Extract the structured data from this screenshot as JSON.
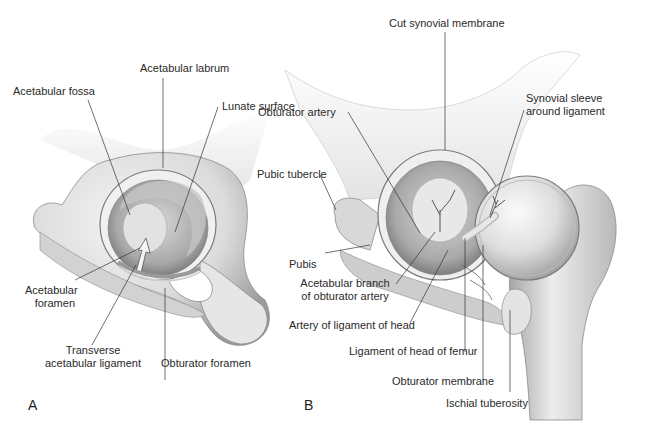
{
  "figure": {
    "panels": [
      {
        "id": "A",
        "letter": "A",
        "labels": {
          "acetabular_labrum": "Acetabular labrum",
          "acetabular_fossa": "Acetabular fossa",
          "lunate_surface": "Lunate surface",
          "acetabular_foramen_l1": "Acetabular",
          "acetabular_foramen_l2": "foramen",
          "transverse_l1": "Transverse",
          "transverse_l2": "acetabular ligament",
          "obturator_foramen": "Obturator foramen"
        }
      },
      {
        "id": "B",
        "letter": "B",
        "labels": {
          "cut_synovial_membrane": "Cut synovial membrane",
          "synovial_sleeve_l1": "Synovial sleeve",
          "synovial_sleeve_l2": "around ligament",
          "obturator_artery": "Obturator artery",
          "pubic_tubercle": "Pubic tubercle",
          "pubis": "Pubis",
          "acetabular_branch_l1": "Acetabular branch",
          "acetabular_branch_l2": "of obturator artery",
          "artery_ligament_head": "Artery of ligament of head",
          "ligament_head_femur": "Ligament of head of femur",
          "obturator_membrane": "Obturator membrane",
          "ischial_tuberosity": "Ischial tuberosity"
        }
      }
    ],
    "colors": {
      "background": "#ffffff",
      "bone_light": "#eeeeee",
      "bone_mid": "#cfcfcf",
      "bone_dark": "#8f8f8f",
      "leader_line": "#333333"
    }
  }
}
